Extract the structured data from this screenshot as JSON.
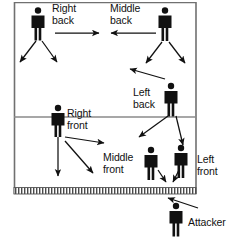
{
  "diagram": {
    "type": "court-formation-diagram",
    "colors": {
      "background": "#ffffff",
      "court_line": "#6e6e6e",
      "figure": "#111111",
      "arrow": "#111111",
      "net_band": "#555555",
      "text": "#111111"
    },
    "court": {
      "left": 14,
      "right": 196,
      "top": 2,
      "bottom": 194,
      "attack_line_y": 117,
      "net_y": 190,
      "net_label": "net"
    },
    "players": [
      {
        "id": "right-back",
        "label_line1": "Right",
        "label_line2": "back",
        "x": 38,
        "y": 24
      },
      {
        "id": "middle-back",
        "label_line1": "Middle",
        "label_line2": "back",
        "x": 165,
        "y": 24
      },
      {
        "id": "left-back",
        "label_line1": "Left",
        "label_line2": "back",
        "x": 171,
        "y": 100
      },
      {
        "id": "right-front",
        "label_line1": "Right",
        "label_line2": "front",
        "x": 58,
        "y": 122
      },
      {
        "id": "middle-front",
        "label_line1": "Middle",
        "label_line2": "front",
        "x": 152,
        "y": 168
      },
      {
        "id": "left-front",
        "label_line1": "Left",
        "label_line2": "front",
        "x": 181,
        "y": 166
      },
      {
        "id": "attacker",
        "label_line1": "Attacker",
        "label_line2": "",
        "x": 207,
        "y": 220
      }
    ],
    "labels": [
      {
        "id": "right-back-label",
        "text": "Right\nback",
        "x": 52,
        "y": 4
      },
      {
        "id": "middle-back-label",
        "text": "Middle\nback",
        "x": 112,
        "y": 4
      },
      {
        "id": "left-back-label",
        "text": "Left\nback",
        "x": 134,
        "y": 88
      },
      {
        "id": "right-front-label",
        "text": "Right\nfront",
        "x": 68,
        "y": 110
      },
      {
        "id": "middle-front-label",
        "text": "Middle\nfront",
        "x": 105,
        "y": 155
      },
      {
        "id": "left-front-label",
        "text": "Left\nfront",
        "x": 194,
        "y": 157
      },
      {
        "id": "attacker-label",
        "text": "Attacker",
        "x": 190,
        "y": 222
      }
    ],
    "arrows": [
      {
        "id": "arrow-rb-to-mb",
        "x1": 55,
        "y1": 33,
        "x2": 100,
        "y2": 33
      },
      {
        "id": "arrow-mb-to-rb",
        "x1": 156,
        "y1": 33,
        "x2": 106,
        "y2": 33
      },
      {
        "id": "arrow-rb-down-left",
        "x1": 36,
        "y1": 40,
        "x2": 19,
        "y2": 62
      },
      {
        "id": "arrow-rb-down-right",
        "x1": 41,
        "y1": 40,
        "x2": 57,
        "y2": 62
      },
      {
        "id": "arrow-mb-down-left",
        "x1": 161,
        "y1": 41,
        "x2": 145,
        "y2": 63
      },
      {
        "id": "arrow-mb-down-right",
        "x1": 168,
        "y1": 41,
        "x2": 185,
        "y2": 63
      },
      {
        "id": "arrow-lb-up-left",
        "x1": 164,
        "y1": 80,
        "x2": 129,
        "y2": 70
      },
      {
        "id": "arrow-lb-down-left",
        "x1": 167,
        "y1": 117,
        "x2": 138,
        "y2": 137
      },
      {
        "id": "arrow-lb-down-right",
        "x1": 175,
        "y1": 117,
        "x2": 182,
        "y2": 147
      },
      {
        "id": "arrow-rf-down",
        "x1": 58,
        "y1": 136,
        "x2": 58,
        "y2": 175
      },
      {
        "id": "arrow-rf-right",
        "x1": 64,
        "y1": 138,
        "x2": 104,
        "y2": 143
      },
      {
        "id": "arrow-rf-down-right",
        "x1": 64,
        "y1": 141,
        "x2": 92,
        "y2": 173
      },
      {
        "id": "arrow-mf-short",
        "x1": 157,
        "y1": 170,
        "x2": 165,
        "y2": 182
      },
      {
        "id": "arrow-lf-short",
        "x1": 178,
        "y1": 170,
        "x2": 172,
        "y2": 182
      },
      {
        "id": "arrow-attacker",
        "x1": 197,
        "y1": 207,
        "x2": 167,
        "y2": 198
      }
    ]
  }
}
